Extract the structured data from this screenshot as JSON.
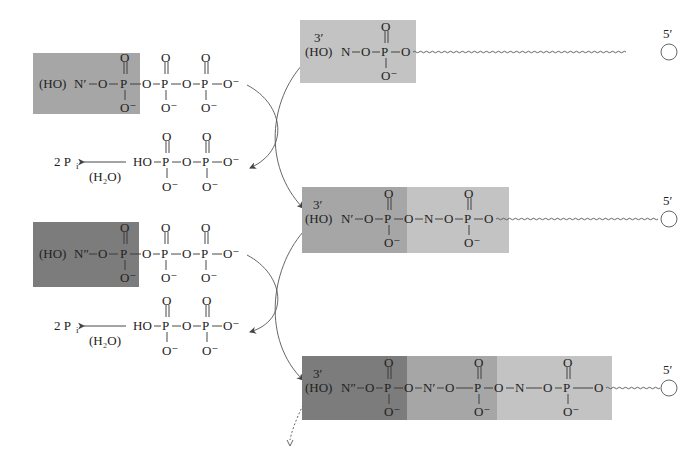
{
  "colors": {
    "nucleotide_N": "#c3c3c3",
    "nucleotide_N1": "#a6a6a6",
    "nucleotide_N2": "#7c7c7c",
    "text": "#222222",
    "background": "#ffffff"
  },
  "labels": {
    "HO": "(HO)",
    "N": "N",
    "N1": "N′",
    "N2": "N″",
    "O": "O",
    "Ominus": "O⁻",
    "P": "P",
    "HO_plain": "HO",
    "three_prime": "3′",
    "five_prime": "5′",
    "pi_product": "2 P",
    "pi_sub": "i",
    "water": "(H₂O)"
  },
  "left_column": [
    {
      "role": "incoming-triphosphate",
      "base": "N′",
      "prefix": "(HO)"
    },
    {
      "role": "released-pyrophosphate",
      "text": "HO",
      "hydrolysis_product": "2 Pi",
      "reagent": "(H₂O)"
    },
    {
      "role": "incoming-triphosphate",
      "base": "N″",
      "prefix": "(HO)"
    },
    {
      "role": "released-pyrophosphate",
      "text": "HO",
      "hydrolysis_product": "2 Pi",
      "reagent": "(H₂O)"
    }
  ],
  "right_column": [
    {
      "role": "growing-chain",
      "end_3": "3′",
      "end_5": "5′",
      "nucleotides": [
        "N"
      ]
    },
    {
      "role": "growing-chain",
      "end_3": "3′",
      "end_5": "5′",
      "nucleotides": [
        "N′",
        "N"
      ]
    },
    {
      "role": "growing-chain",
      "end_3": "3′",
      "end_5": "5′",
      "nucleotides": [
        "N″",
        "N′",
        "N"
      ]
    }
  ]
}
